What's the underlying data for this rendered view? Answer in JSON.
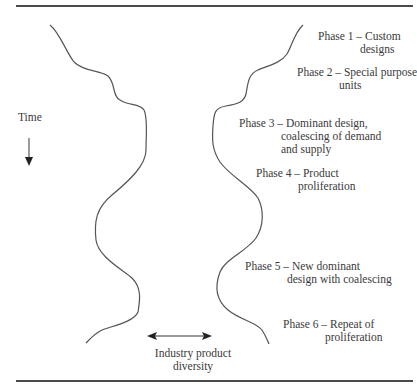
{
  "diagram": {
    "type": "industry-evolution-phases",
    "axis_time_label": "Time",
    "axis_diversity_label_line1": "Industry product",
    "axis_diversity_label_line2": "diversity",
    "phases": [
      {
        "title": "Phase 1 – Custom",
        "line2": "designs"
      },
      {
        "title": "Phase 2 – Special purpose",
        "line2": "units"
      },
      {
        "title": "Phase 3 – Dominant design,",
        "line2": "coalescing of demand",
        "line3": "and supply"
      },
      {
        "title": "Phase 4 – Product",
        "line2": "proliferation"
      },
      {
        "title": "Phase 5 – New dominant",
        "line2": "design with coalescing"
      },
      {
        "title": "Phase 6 – Repeat of",
        "line2": "proliferation"
      }
    ],
    "colors": {
      "line": "#555555",
      "text": "#3a3a3a",
      "rule": "#4a4a4a"
    }
  }
}
